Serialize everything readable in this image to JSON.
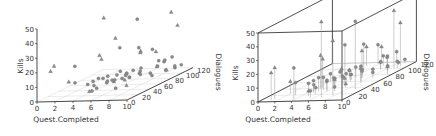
{
  "chart_data": [
    {
      "type": "scatter",
      "variant": "3d-scatter",
      "title": "",
      "xlabel": "Quest.Completed",
      "ylabel": "Dialogues",
      "zlabel": "Kills",
      "xlim": [
        0,
        10
      ],
      "ylim": [
        0,
        120
      ],
      "zlim": [
        0,
        50
      ],
      "xticks": [
        "0",
        "2",
        "4",
        "6",
        "8",
        "10"
      ],
      "yticks": [
        "0",
        "20",
        "40",
        "60",
        "80",
        "100",
        "120"
      ],
      "zticks": [
        "0",
        "10",
        "20",
        "30",
        "40",
        "50"
      ],
      "box": false,
      "droplines": false,
      "grid": "floor"
    },
    {
      "type": "scatter",
      "variant": "3d-scatter",
      "title": "",
      "xlabel": "Quest.Completed",
      "ylabel": "Dialogues",
      "zlabel": "Kills",
      "xlim": [
        0,
        10
      ],
      "ylim": [
        0,
        120
      ],
      "zlim": [
        0,
        50
      ],
      "xticks": [
        "0",
        "2",
        "4",
        "6",
        "8",
        "10"
      ],
      "yticks": [
        "0",
        "20",
        "40",
        "60",
        "80",
        "100",
        "120"
      ],
      "zticks": [
        "0",
        "10",
        "20",
        "30",
        "40",
        "50"
      ],
      "box": true,
      "droplines": true,
      "grid": "floor"
    }
  ],
  "points": [
    {
      "x": 1.2,
      "y": 5,
      "z": 20,
      "m": "t"
    },
    {
      "x": 1.4,
      "y": 8,
      "z": 23,
      "m": "t"
    },
    {
      "x": 3.9,
      "y": 5,
      "z": 23,
      "m": "c"
    },
    {
      "x": 2.0,
      "y": 25,
      "z": 9,
      "m": "t"
    },
    {
      "x": 3.0,
      "y": 20,
      "z": 9,
      "m": "c"
    },
    {
      "x": 4.5,
      "y": 40,
      "z": 24,
      "m": "t"
    },
    {
      "x": 4.6,
      "y": 42,
      "z": 21,
      "m": "t"
    },
    {
      "x": 3.8,
      "y": 30,
      "z": 6,
      "m": "c"
    },
    {
      "x": 4.4,
      "y": 30,
      "z": 8,
      "m": "c"
    },
    {
      "x": 4.8,
      "y": 25,
      "z": 6,
      "m": "c"
    },
    {
      "x": 5.0,
      "y": 30,
      "z": 10,
      "m": "c"
    },
    {
      "x": 5.2,
      "y": 35,
      "z": 9,
      "m": "c"
    },
    {
      "x": 5.4,
      "y": 20,
      "z": 5,
      "m": "c"
    },
    {
      "x": 5.6,
      "y": 35,
      "z": 6,
      "m": "c"
    },
    {
      "x": 5.8,
      "y": 45,
      "z": 5,
      "m": "t"
    },
    {
      "x": 4.9,
      "y": 15,
      "z": 4,
      "m": "t"
    },
    {
      "x": 5.5,
      "y": 10,
      "z": 5,
      "m": "c"
    },
    {
      "x": 6.0,
      "y": 30,
      "z": 8,
      "m": "c"
    },
    {
      "x": 6.2,
      "y": 40,
      "z": 7,
      "m": "c"
    },
    {
      "x": 6.4,
      "y": 50,
      "z": 6,
      "m": "c"
    },
    {
      "x": 6.6,
      "y": 60,
      "z": 5,
      "m": "c"
    },
    {
      "x": 6.8,
      "y": 50,
      "z": 8,
      "m": "c"
    },
    {
      "x": 5.9,
      "y": 55,
      "z": 10,
      "m": "c"
    },
    {
      "x": 6.3,
      "y": 65,
      "z": 4,
      "m": "c"
    },
    {
      "x": 7.0,
      "y": 45,
      "z": 6,
      "m": "t"
    },
    {
      "x": 5.3,
      "y": 50,
      "z": 5,
      "m": "c"
    },
    {
      "x": 5.7,
      "y": 70,
      "z": 6,
      "m": "c"
    },
    {
      "x": 6.5,
      "y": 80,
      "z": 4,
      "m": "c"
    },
    {
      "x": 6.1,
      "y": 75,
      "z": 7,
      "m": "c"
    },
    {
      "x": 7.2,
      "y": 70,
      "z": 5,
      "m": "c"
    },
    {
      "x": 7.4,
      "y": 85,
      "z": 3,
      "m": "c"
    },
    {
      "x": 4.2,
      "y": 60,
      "z": 6,
      "m": "c"
    },
    {
      "x": 4.6,
      "y": 70,
      "z": 5,
      "m": "c"
    },
    {
      "x": 5.0,
      "y": 80,
      "z": 4,
      "m": "t"
    },
    {
      "x": 7.8,
      "y": 60,
      "z": 9,
      "m": "c"
    },
    {
      "x": 8.2,
      "y": 55,
      "z": 12,
      "m": "c"
    },
    {
      "x": 8.5,
      "y": 70,
      "z": 4,
      "m": "c"
    },
    {
      "x": 7.5,
      "y": 40,
      "z": 3,
      "m": "t"
    },
    {
      "x": 6.9,
      "y": 30,
      "z": 3,
      "m": "c"
    },
    {
      "x": 7.6,
      "y": 95,
      "z": 6,
      "m": "c"
    },
    {
      "x": 8.0,
      "y": 100,
      "z": 8,
      "m": "c"
    },
    {
      "x": 8.4,
      "y": 95,
      "z": 10,
      "m": "c"
    },
    {
      "x": 7.2,
      "y": 100,
      "z": 5,
      "m": "t"
    },
    {
      "x": 8.8,
      "y": 90,
      "z": 4,
      "m": "c"
    },
    {
      "x": 9.2,
      "y": 100,
      "z": 5,
      "m": "c"
    },
    {
      "x": 6.8,
      "y": 110,
      "z": 7,
      "m": "c"
    },
    {
      "x": 9.5,
      "y": 80,
      "z": 6,
      "m": "t"
    },
    {
      "x": 9.0,
      "y": 115,
      "z": 3,
      "m": "c"
    },
    {
      "x": 8.6,
      "y": 110,
      "z": 2,
      "m": "c"
    },
    {
      "x": 6.8,
      "y": 10,
      "z": 55,
      "m": "t"
    },
    {
      "x": 9.0,
      "y": 35,
      "z": 49,
      "m": "c"
    },
    {
      "x": 7.8,
      "y": 15,
      "z": 40,
      "m": "t"
    },
    {
      "x": 8.8,
      "y": 100,
      "z": 42,
      "m": "t"
    },
    {
      "x": 9.2,
      "y": 105,
      "z": 32,
      "m": "t"
    },
    {
      "x": 7.2,
      "y": 70,
      "z": 20,
      "m": "t"
    },
    {
      "x": 3.7,
      "y": 90,
      "z": 20,
      "m": "c"
    },
    {
      "x": 5.2,
      "y": 100,
      "z": 18,
      "m": "c"
    },
    {
      "x": 4.8,
      "y": 110,
      "z": 14,
      "m": "t"
    },
    {
      "x": 5.8,
      "y": 115,
      "z": 14,
      "m": "c"
    },
    {
      "x": 6.0,
      "y": 118,
      "z": 12,
      "m": "t"
    },
    {
      "x": 7.8,
      "y": 118,
      "z": 8,
      "m": "c"
    }
  ]
}
